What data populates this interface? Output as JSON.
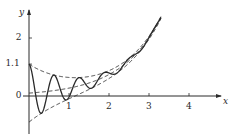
{
  "chart_data": {
    "type": "line",
    "title": "",
    "xlabel": "x",
    "ylabel": "y",
    "xlim": [
      0,
      4.8
    ],
    "ylim": [
      -1.2,
      2.8
    ],
    "grid": false,
    "legend": null,
    "x_ticks": [
      {
        "value": 1,
        "label": "1"
      },
      {
        "value": 2,
        "label": "2"
      },
      {
        "value": 3,
        "label": "3"
      },
      {
        "value": 4,
        "label": "4"
      }
    ],
    "y_ticks": [
      {
        "value": 0,
        "label": "0"
      },
      {
        "value": 1.1,
        "label": "1.1"
      },
      {
        "value": 2,
        "label": "2"
      }
    ],
    "x_range_plotted": [
      0,
      3.3
    ],
    "series": [
      {
        "name": "oscillating curve",
        "style": "solid",
        "formula": "0.1*e^x + e^(-x)*cos(10x)",
        "points": [
          [
            0,
            1.1
          ],
          [
            0.31,
            -0.6
          ],
          [
            0.63,
            0.72
          ],
          [
            0.94,
            -0.13
          ],
          [
            1.26,
            0.63
          ],
          [
            1.57,
            0.31
          ],
          [
            1.88,
            0.81
          ],
          [
            2.2,
            0.79
          ],
          [
            2.51,
            1.31
          ],
          [
            2.83,
            1.75
          ],
          [
            3.14,
            2.35
          ],
          [
            3.3,
            2.66
          ]
        ]
      },
      {
        "name": "upper envelope",
        "style": "dashed",
        "formula": "0.1*e^x + e^(-x)",
        "points": [
          [
            0,
            1.1
          ],
          [
            0.5,
            0.77
          ],
          [
            1,
            0.64
          ],
          [
            1.15,
            0.63
          ],
          [
            1.5,
            0.67
          ],
          [
            2,
            0.87
          ],
          [
            2.5,
            1.3
          ],
          [
            3,
            2.06
          ],
          [
            3.3,
            2.75
          ]
        ]
      },
      {
        "name": "middle trend",
        "style": "dashed",
        "formula": "0.1*e^x",
        "points": [
          [
            0,
            0.1
          ],
          [
            0.5,
            0.16
          ],
          [
            1,
            0.27
          ],
          [
            1.5,
            0.45
          ],
          [
            2,
            0.74
          ],
          [
            2.5,
            1.22
          ],
          [
            3,
            2.01
          ],
          [
            3.3,
            2.71
          ]
        ]
      },
      {
        "name": "lower envelope",
        "style": "dashed",
        "formula": "0.1*e^x - e^(-x)",
        "points": [
          [
            0,
            -0.9
          ],
          [
            0.5,
            -0.44
          ],
          [
            1,
            -0.1
          ],
          [
            1.5,
            0.23
          ],
          [
            2,
            0.6
          ],
          [
            2.5,
            1.14
          ],
          [
            3,
            1.96
          ],
          [
            3.3,
            2.67
          ]
        ]
      }
    ],
    "annotations": []
  },
  "axes": {
    "x_name": "x",
    "y_name": "y"
  },
  "colors": {
    "ink": "#2a2a2a",
    "background": "#ffffff"
  }
}
